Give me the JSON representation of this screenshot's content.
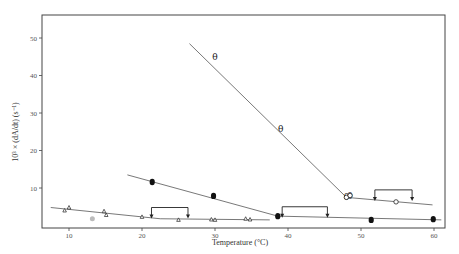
{
  "chart_data": {
    "type": "scatter",
    "title": "",
    "xlabel": "Temperature (°C)",
    "ylabel": "10³ × (dA/dt) (s⁻¹)",
    "xlim": [
      6,
      62
    ],
    "ylim": [
      0,
      55
    ],
    "x_ticks": [
      10,
      20,
      30,
      40,
      50,
      60
    ],
    "y_ticks": [
      10,
      20,
      30,
      40,
      50
    ],
    "grid": false,
    "legend": null,
    "series": [
      {
        "name": "theta-marker series",
        "marker": "θ",
        "points": [
          [
            30,
            45
          ],
          [
            39,
            25.7
          ],
          [
            48,
            7.5
          ],
          [
            48.5,
            8
          ]
        ],
        "fit_line": [
          [
            26.5,
            48.5
          ],
          [
            48,
            7.5
          ]
        ]
      },
      {
        "name": "open-circle series",
        "marker": "open-circle",
        "points": [
          [
            48,
            7.5
          ],
          [
            48.5,
            8
          ],
          [
            54.8,
            6.3
          ]
        ],
        "fit_line": [
          [
            48,
            7.5
          ],
          [
            59.8,
            5.5
          ]
        ]
      },
      {
        "name": "filled-circle upper series",
        "marker": "filled-circle",
        "points": [
          [
            21.4,
            11.6
          ],
          [
            29.8,
            7.9
          ],
          [
            38.6,
            2.5
          ]
        ],
        "fit_line": [
          [
            18,
            13.5
          ],
          [
            38.6,
            2.5
          ]
        ]
      },
      {
        "name": "filled-circle lower series",
        "marker": "filled-circle",
        "points": [
          [
            38.6,
            2.5
          ],
          [
            51.4,
            1.5
          ],
          [
            59.9,
            1.7
          ]
        ],
        "fit_line": [
          [
            38.6,
            2.5
          ],
          [
            61,
            1.5
          ]
        ]
      },
      {
        "name": "triangle series",
        "marker": "open-triangle",
        "points": [
          [
            9.4,
            4.0
          ],
          [
            10.0,
            4.8
          ],
          [
            14.8,
            3.8
          ],
          [
            15.1,
            2.8
          ],
          [
            20,
            2.3
          ],
          [
            25,
            1.5
          ],
          [
            29.5,
            1.6
          ],
          [
            30,
            1.5
          ],
          [
            34.2,
            1.8
          ],
          [
            34.8,
            1.6
          ]
        ],
        "fit_line": [
          [
            7.5,
            4.8
          ],
          [
            20,
            2.3
          ],
          [
            22.5,
            1.8
          ],
          [
            37.5,
            1.5
          ]
        ]
      },
      {
        "name": "outlier",
        "marker": "grey-dot",
        "points": [
          [
            13.2,
            1.8
          ]
        ]
      }
    ],
    "annotations": [
      {
        "type": "bracket-arrows",
        "x_from": 21.3,
        "x_to": 26.3,
        "y": 4.8
      },
      {
        "type": "bracket-arrows",
        "x_from": 39.2,
        "x_to": 45.4,
        "y": 5.0
      },
      {
        "type": "bracket-arrows",
        "x_from": 51.9,
        "x_to": 57.0,
        "y": 9.5
      }
    ]
  },
  "axes": {
    "x_title": "Temperature (°C)",
    "y_title": "10³ × (dA/dt) (s⁻¹)",
    "x_tick_labels": [
      "10",
      "20",
      "30",
      "40",
      "50",
      "60"
    ],
    "y_tick_labels": [
      "10",
      "20",
      "30",
      "40",
      "50"
    ]
  }
}
